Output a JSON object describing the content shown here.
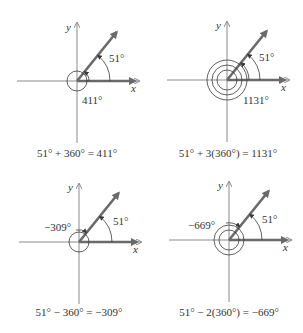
{
  "figure": {
    "panels": [
      {
        "id": "panel-411",
        "origin": [
          77,
          81
        ],
        "reference_angle_label": "51°",
        "coterminal_label": "411°",
        "coterminal_label_pos": [
          82,
          104
        ],
        "ref_label_pos": [
          109,
          62
        ],
        "rotations": 1,
        "direction": "counterclockwise",
        "x_label": "x",
        "y_label": "y",
        "caption": "51° + 360° = 411°",
        "caption_pos": [
          77,
          157
        ]
      },
      {
        "id": "panel-1131",
        "origin": [
          227,
          80
        ],
        "reference_angle_label": "51°",
        "coterminal_label": "1131°",
        "coterminal_label_pos": [
          243,
          104
        ],
        "ref_label_pos": [
          259,
          61
        ],
        "rotations": 3,
        "direction": "counterclockwise",
        "x_label": "x",
        "y_label": "y",
        "caption": "51° + 3(360°) = 1131°",
        "caption_pos": [
          228,
          157
        ]
      },
      {
        "id": "panel-neg309",
        "origin": [
          79,
          242
        ],
        "reference_angle_label": "51°",
        "coterminal_label": "−309°",
        "coterminal_label_pos": [
          44,
          231
        ],
        "ref_label_pos": [
          113,
          225
        ],
        "rotations": 1,
        "direction": "clockwise",
        "x_label": "x",
        "y_label": "y",
        "caption": "51° − 360° = −309°",
        "caption_pos": [
          79,
          316
        ]
      },
      {
        "id": "panel-neg669",
        "origin": [
          229,
          240
        ],
        "reference_angle_label": "51°",
        "coterminal_label": "−669°",
        "coterminal_label_pos": [
          188,
          229
        ],
        "ref_label_pos": [
          262,
          223
        ],
        "rotations": 2,
        "direction": "clockwise",
        "x_label": "x",
        "y_label": "y",
        "caption": "51° − 2(360°) = −669°",
        "caption_pos": [
          229,
          316
        ]
      }
    ]
  }
}
